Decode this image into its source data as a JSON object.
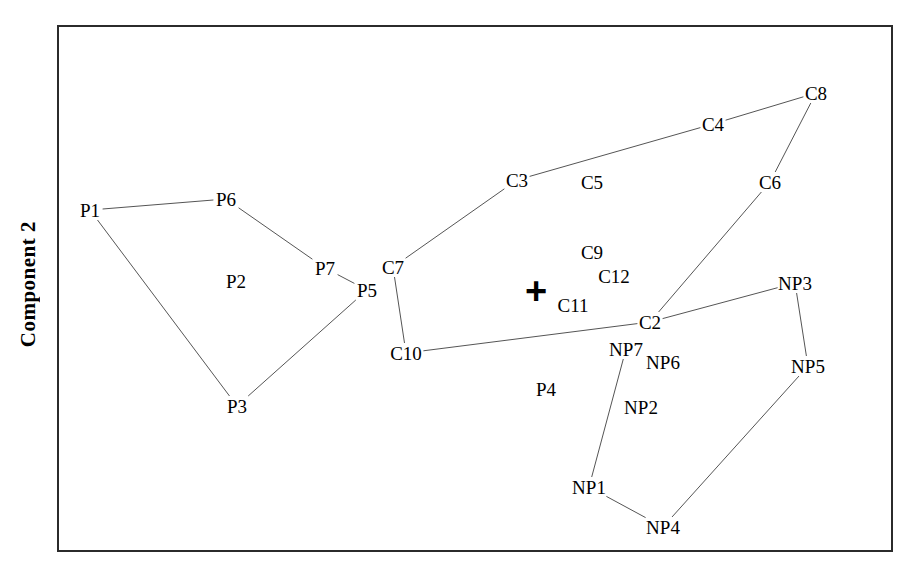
{
  "axes": {
    "y_label": "Component 2"
  },
  "marker": {
    "symbol": "+",
    "name": "origin-cross-marker",
    "x": 536,
    "y": 291
  },
  "chart_data": {
    "type": "scatter",
    "title": "",
    "xlabel": "",
    "ylabel": "Component 2",
    "grid": false,
    "legend": null,
    "xlim": [
      57,
      893
    ],
    "ylim": [
      25,
      552
    ],
    "note": "Perceptual/correspondence map with labelled points joined by line segments (minimum spanning style links). Coordinates are in screenshot pixel space; y increases downward.",
    "points": [
      {
        "label": "P1",
        "x": 90,
        "y": 210
      },
      {
        "label": "P6",
        "x": 226,
        "y": 199
      },
      {
        "label": "P2",
        "x": 236,
        "y": 281
      },
      {
        "label": "P7",
        "x": 325,
        "y": 268
      },
      {
        "label": "P5",
        "x": 367,
        "y": 290
      },
      {
        "label": "P3",
        "x": 237,
        "y": 406
      },
      {
        "label": "C7",
        "x": 393,
        "y": 267
      },
      {
        "label": "C10",
        "x": 406,
        "y": 353
      },
      {
        "label": "C3",
        "x": 517,
        "y": 180
      },
      {
        "label": "C5",
        "x": 592,
        "y": 182
      },
      {
        "label": "C4",
        "x": 713,
        "y": 124
      },
      {
        "label": "C8",
        "x": 816,
        "y": 93
      },
      {
        "label": "C6",
        "x": 770,
        "y": 182
      },
      {
        "label": "C9",
        "x": 592,
        "y": 252
      },
      {
        "label": "C12",
        "x": 614,
        "y": 276
      },
      {
        "label": "C11",
        "x": 573,
        "y": 305
      },
      {
        "label": "C2",
        "x": 650,
        "y": 322
      },
      {
        "label": "NP3",
        "x": 795,
        "y": 283
      },
      {
        "label": "NP5",
        "x": 808,
        "y": 366
      },
      {
        "label": "NP7",
        "x": 626,
        "y": 349
      },
      {
        "label": "NP6",
        "x": 663,
        "y": 362
      },
      {
        "label": "NP2",
        "x": 641,
        "y": 407
      },
      {
        "label": "P4",
        "x": 546,
        "y": 389
      },
      {
        "label": "NP1",
        "x": 589,
        "y": 487
      },
      {
        "label": "NP4",
        "x": 663,
        "y": 527
      }
    ],
    "edges": [
      {
        "from": "P1",
        "to": "P6"
      },
      {
        "from": "P6",
        "to": "P7"
      },
      {
        "from": "P7",
        "to": "P5"
      },
      {
        "from": "P1",
        "to": "P3"
      },
      {
        "from": "P3",
        "to": "P5"
      },
      {
        "from": "C7",
        "to": "C10"
      },
      {
        "from": "C7",
        "to": "C3"
      },
      {
        "from": "C3",
        "to": "C4"
      },
      {
        "from": "C4",
        "to": "C8"
      },
      {
        "from": "C8",
        "to": "C6"
      },
      {
        "from": "C6",
        "to": "C2"
      },
      {
        "from": "C10",
        "to": "C2"
      },
      {
        "from": "C2",
        "to": "NP3"
      },
      {
        "from": "NP3",
        "to": "NP5"
      },
      {
        "from": "NP7",
        "to": "NP1"
      },
      {
        "from": "NP1",
        "to": "NP4"
      },
      {
        "from": "NP4",
        "to": "NP5"
      }
    ],
    "groups": [
      {
        "prefix": "P",
        "name": "P-series points",
        "members": [
          "P1",
          "P2",
          "P3",
          "P4",
          "P5",
          "P6",
          "P7"
        ]
      },
      {
        "prefix": "C",
        "name": "C-series points",
        "members": [
          "C2",
          "C3",
          "C4",
          "C5",
          "C6",
          "C7",
          "C8",
          "C9",
          "C10",
          "C11",
          "C12"
        ]
      },
      {
        "prefix": "NP",
        "name": "NP-series points",
        "members": [
          "NP1",
          "NP2",
          "NP3",
          "NP4",
          "NP5",
          "NP6",
          "NP7"
        ]
      }
    ],
    "line_color": "#555555",
    "text_color": "#000000",
    "border_color": "#2b2b2b"
  }
}
